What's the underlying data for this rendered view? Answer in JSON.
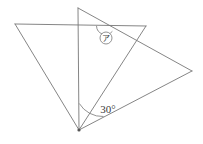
{
  "figure": {
    "background_color": "#ffffff",
    "line_color": "#777777",
    "text_color": "#3a3a3a",
    "width": 203,
    "height": 144,
    "points": {
      "top_apex": {
        "name": "top-apex",
        "x": 78,
        "y": 8
      },
      "left": {
        "name": "left-vertex",
        "x": 15,
        "y": 24
      },
      "upper_right": {
        "name": "upper-right-vertex",
        "x": 146,
        "y": 26
      },
      "right": {
        "name": "right-vertex",
        "x": 192,
        "y": 71
      },
      "bottom_apex": {
        "name": "bottom-apex",
        "x": 79,
        "y": 130
      },
      "intersection": {
        "name": "intersection-point",
        "x": 105,
        "y": 26
      }
    },
    "segments": [
      {
        "name": "segment-left-to-upper-right",
        "from": "left",
        "to": "upper_right"
      },
      {
        "name": "segment-left-to-bottom-apex",
        "from": "left",
        "to": "bottom_apex"
      },
      {
        "name": "segment-top-apex-to-bottom-apex",
        "from": "top_apex",
        "to": "bottom_apex"
      },
      {
        "name": "segment-top-apex-to-right",
        "from": "top_apex",
        "to": "right"
      },
      {
        "name": "segment-upper-right-to-bottom-apex",
        "from": "upper_right",
        "to": "bottom_apex"
      },
      {
        "name": "segment-right-to-bottom-apex",
        "from": "right",
        "to": "bottom_apex"
      }
    ],
    "labels": {
      "angle_30": {
        "text": "30°",
        "x": 108,
        "y": 113
      },
      "circled_marker": {
        "text": "ア",
        "cx": 106,
        "cy": 38,
        "r": 6
      }
    }
  }
}
